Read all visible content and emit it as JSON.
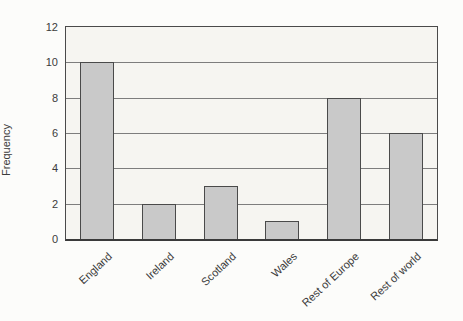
{
  "chart_data": {
    "type": "bar",
    "categories": [
      "England",
      "Ireland",
      "Scotland",
      "Wales",
      "Rest of Europe",
      "Rest of world"
    ],
    "values": [
      10,
      2,
      3,
      1,
      8,
      6
    ],
    "title": "",
    "xlabel": "",
    "ylabel": "Frequency",
    "ylim": [
      0,
      12
    ],
    "ytick_step": 2,
    "yticks": [
      0,
      2,
      4,
      6,
      8,
      10,
      12
    ],
    "grid": "horizontal",
    "legend": "none",
    "colors": {
      "bar_fill": "#c9c9c9",
      "bar_border": "#4a4a4a",
      "plot_background": "#f6f5f1",
      "grid_line": "#7d7d7d",
      "axis_line": "#3a3a3a",
      "text": "#3b3b3b",
      "page_background": "#fcfcfa"
    }
  }
}
